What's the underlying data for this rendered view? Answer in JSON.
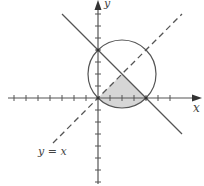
{
  "diagram": {
    "axes": {
      "x_label": "x",
      "y_label": "y",
      "x_ticks": [
        -7,
        -6,
        -5,
        -4,
        -3,
        -2,
        -1,
        1,
        2,
        3,
        4,
        5,
        6
      ],
      "y_ticks": [
        -7,
        -6,
        -5,
        -4,
        -3,
        -2,
        -1,
        1,
        2,
        3,
        4,
        5,
        6,
        7
      ]
    },
    "circle": {
      "center": [
        2,
        2
      ],
      "radius_sq": 8,
      "description": "circle through origin centered at (2,2)"
    },
    "solid_line": {
      "equation": "x + y = 4"
    },
    "dashed_line": {
      "equation": "y = x",
      "label": "y = x"
    },
    "shaded_region": {
      "description": "region bounded by y = x, x + y = 4, and the circle arc below the x-axis"
    },
    "colors": {
      "stroke": "#555555",
      "fill": "#d6d6d6",
      "dashed": "#555555"
    }
  }
}
